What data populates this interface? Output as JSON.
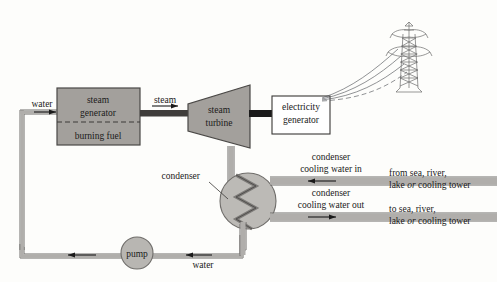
{
  "diagram": {
    "colors": {
      "pipe_fill": "#b0aeab",
      "pipe_stroke": "#6f6d6a",
      "block_fill": "#a3a09c",
      "block_stroke": "#4a4846",
      "condenser_fill": "#bcbab6",
      "pump_fill": "#b8b6b2",
      "shaft": "#1b1b1b",
      "text": "#1a1a1a",
      "page_bg": "#fdfdfb",
      "tower_stroke": "#6b6b6b"
    },
    "labels": {
      "water_in": "water",
      "steam_generator_line1": "steam",
      "steam_generator_line2": "generator",
      "burning_fuel": "burning fuel",
      "steam": "steam",
      "steam_turbine_line1": "steam",
      "steam_turbine_line2": "turbine",
      "electricity_generator_line1": "electricity",
      "electricity_generator_line2": "generator",
      "condenser": "condenser",
      "cooling_water_in_line1": "condenser",
      "cooling_water_in_line2": "cooling water in",
      "cooling_water_out_line1": "condenser",
      "cooling_water_out_line2": "cooling water out",
      "source_in_line1": "from sea, river,",
      "source_in_line2_a": "lake ",
      "source_in_line2_em": "or",
      "source_in_line2_b": " cooling tower",
      "source_out_line1": "to sea, river,",
      "source_out_line2_a": "lake ",
      "source_out_line2_em": "or",
      "source_out_line2_b": " cooling tower",
      "pump": "pump",
      "water_return": "water"
    }
  }
}
